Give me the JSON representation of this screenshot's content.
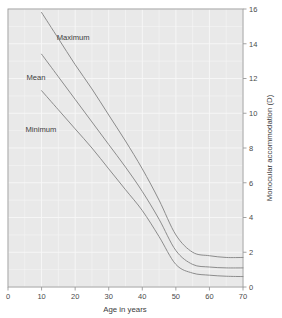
{
  "chart_data": {
    "type": "line",
    "title": "",
    "subtitle": "",
    "xlabel": "Age in years",
    "ylabel": "Monocular accommodation (D)",
    "xlim": [
      0,
      70
    ],
    "ylim": [
      0,
      16
    ],
    "xticks": [
      0,
      10,
      20,
      30,
      40,
      50,
      60,
      70
    ],
    "yticks": [
      0,
      2,
      4,
      6,
      8,
      10,
      12,
      14,
      16
    ],
    "xticklabels": [
      "0",
      "10",
      "20",
      "30",
      "40",
      "50",
      "60",
      "70"
    ],
    "yticklabels": [
      "0",
      "2",
      "4",
      "6",
      "8",
      "10",
      "12",
      "14",
      "16"
    ],
    "grid": true,
    "y_axis_position": "right",
    "legend": "inline-labels",
    "plot_background": "#e9e9e9",
    "grid_color": "#f7f7f7",
    "line_color": "#8c8c8c",
    "x": [
      10,
      15,
      20,
      25,
      30,
      35,
      40,
      45,
      50,
      55,
      60,
      65,
      70
    ],
    "series": [
      {
        "name": "Maximum",
        "label": "Maximum",
        "values": [
          15.8,
          14.3,
          12.8,
          11.4,
          9.9,
          8.4,
          6.8,
          5.0,
          3.0,
          2.0,
          1.8,
          1.7,
          1.7
        ]
      },
      {
        "name": "Mean",
        "label": "Mean",
        "values": [
          13.4,
          12.1,
          10.8,
          9.5,
          8.2,
          6.9,
          5.5,
          3.9,
          2.1,
          1.3,
          1.15,
          1.1,
          1.1
        ]
      },
      {
        "name": "Minimum",
        "label": "Minimum",
        "values": [
          11.3,
          10.2,
          9.1,
          8.0,
          6.8,
          5.6,
          4.4,
          2.9,
          1.3,
          0.8,
          0.68,
          0.62,
          0.6
        ]
      }
    ],
    "annotations": [
      {
        "text": "Maximum",
        "x": 14.5,
        "y": 14.2
      },
      {
        "text": "Mean",
        "x": 5.5,
        "y": 11.9
      },
      {
        "text": "Minimum",
        "x": 5.2,
        "y": 8.9
      }
    ]
  }
}
